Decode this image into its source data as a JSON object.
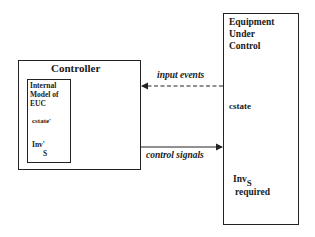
{
  "controller": {
    "title": "Controller",
    "internal_model": {
      "line1": "Internal",
      "line2": "Model of",
      "line3": "EUC",
      "cstate": "cstate'",
      "inv_main": "Inv'",
      "inv_sub": "S"
    }
  },
  "euc": {
    "line1": "Equipment",
    "line2": "Under",
    "line3": "Control",
    "cstate": "cstate",
    "inv_main": "Inv",
    "inv_sub": "S",
    "required": "required"
  },
  "arrows": {
    "input_events": "input events",
    "control_signals": "control signals"
  }
}
